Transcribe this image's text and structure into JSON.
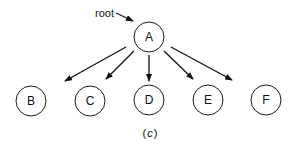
{
  "diagram": {
    "type": "tree",
    "root_pointer_label": "root",
    "root": "A",
    "nodes": [
      {
        "id": "A",
        "label": "A"
      },
      {
        "id": "B",
        "label": "B"
      },
      {
        "id": "C",
        "label": "C"
      },
      {
        "id": "D",
        "label": "D"
      },
      {
        "id": "E",
        "label": "E"
      },
      {
        "id": "F",
        "label": "F"
      }
    ],
    "edges": [
      {
        "from": "A",
        "to": "B"
      },
      {
        "from": "A",
        "to": "C"
      },
      {
        "from": "A",
        "to": "D"
      },
      {
        "from": "A",
        "to": "E"
      },
      {
        "from": "A",
        "to": "F"
      }
    ],
    "caption_open": "(",
    "caption_letter": "c",
    "caption_close": ")"
  }
}
